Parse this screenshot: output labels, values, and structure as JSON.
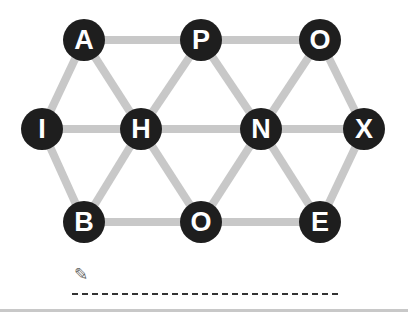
{
  "puzzle": {
    "edge_color": "#c8c8c8",
    "node_color": "#1e1e1e",
    "nodes": [
      {
        "id": "n1",
        "letter": "A",
        "x": 84,
        "y": 40
      },
      {
        "id": "n2",
        "letter": "P",
        "x": 201,
        "y": 40
      },
      {
        "id": "n3",
        "letter": "O",
        "x": 320,
        "y": 40
      },
      {
        "id": "n4",
        "letter": "I",
        "x": 42,
        "y": 129
      },
      {
        "id": "n5",
        "letter": "H",
        "x": 141,
        "y": 129
      },
      {
        "id": "n6",
        "letter": "N",
        "x": 261,
        "y": 129
      },
      {
        "id": "n7",
        "letter": "X",
        "x": 364,
        "y": 129
      },
      {
        "id": "n8",
        "letter": "B",
        "x": 84,
        "y": 222
      },
      {
        "id": "n9",
        "letter": "O",
        "x": 201,
        "y": 222
      },
      {
        "id": "n10",
        "letter": "E",
        "x": 320,
        "y": 222
      }
    ],
    "edges": [
      [
        "n1",
        "n2"
      ],
      [
        "n2",
        "n3"
      ],
      [
        "n1",
        "n4"
      ],
      [
        "n1",
        "n5"
      ],
      [
        "n2",
        "n5"
      ],
      [
        "n2",
        "n6"
      ],
      [
        "n3",
        "n6"
      ],
      [
        "n3",
        "n7"
      ],
      [
        "n4",
        "n5"
      ],
      [
        "n5",
        "n6"
      ],
      [
        "n6",
        "n7"
      ],
      [
        "n4",
        "n8"
      ],
      [
        "n5",
        "n8"
      ],
      [
        "n5",
        "n9"
      ],
      [
        "n6",
        "n9"
      ],
      [
        "n6",
        "n10"
      ],
      [
        "n7",
        "n10"
      ],
      [
        "n8",
        "n9"
      ],
      [
        "n9",
        "n10"
      ]
    ]
  },
  "answer": {
    "pencil_icon": "✎",
    "value": ""
  }
}
